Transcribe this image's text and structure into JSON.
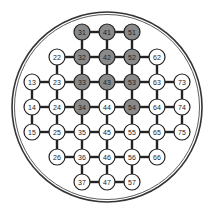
{
  "diagram": {
    "type": "solitaire-board",
    "colors": {
      "filled": "#8a8a8a",
      "empty": "#ffffff",
      "line": "#222222",
      "ring": "#333333"
    },
    "grid": {
      "origin_x": 32,
      "origin_y": 32,
      "step": 25,
      "node_radius": 8
    },
    "ring": {
      "cx": 107,
      "cy": 107,
      "r_outer": 95,
      "r_inner": 92.5
    },
    "nodes": [
      {
        "id": "31",
        "col": 3,
        "row": 1,
        "filled": true
      },
      {
        "id": "41",
        "col": 4,
        "row": 1,
        "filled": true
      },
      {
        "id": "51",
        "col": 5,
        "row": 1,
        "filled": true
      },
      {
        "id": "22",
        "col": 2,
        "row": 2,
        "filled": false
      },
      {
        "id": "32",
        "col": 3,
        "row": 2,
        "filled": true
      },
      {
        "id": "42",
        "col": 4,
        "row": 2,
        "filled": true
      },
      {
        "id": "52",
        "col": 5,
        "row": 2,
        "filled": true
      },
      {
        "id": "62",
        "col": 6,
        "row": 2,
        "filled": false
      },
      {
        "id": "13",
        "col": 1,
        "row": 3,
        "filled": false
      },
      {
        "id": "23",
        "col": 2,
        "row": 3,
        "filled": false
      },
      {
        "id": "33",
        "col": 3,
        "row": 3,
        "filled": true
      },
      {
        "id": "43",
        "col": 4,
        "row": 3,
        "filled": true
      },
      {
        "id": "53",
        "col": 5,
        "row": 3,
        "filled": true
      },
      {
        "id": "63",
        "col": 6,
        "row": 3,
        "filled": false
      },
      {
        "id": "73",
        "col": 7,
        "row": 3,
        "filled": false
      },
      {
        "id": "14",
        "col": 1,
        "row": 4,
        "filled": false
      },
      {
        "id": "24",
        "col": 2,
        "row": 4,
        "filled": false
      },
      {
        "id": "34",
        "col": 3,
        "row": 4,
        "filled": true
      },
      {
        "id": "44",
        "col": 4,
        "row": 4,
        "filled": false
      },
      {
        "id": "54",
        "col": 5,
        "row": 4,
        "filled": true
      },
      {
        "id": "64",
        "col": 6,
        "row": 4,
        "filled": false
      },
      {
        "id": "74",
        "col": 7,
        "row": 4,
        "filled": false
      },
      {
        "id": "15",
        "col": 1,
        "row": 5,
        "filled": false
      },
      {
        "id": "25",
        "col": 2,
        "row": 5,
        "filled": false
      },
      {
        "id": "35",
        "col": 3,
        "row": 5,
        "filled": false
      },
      {
        "id": "45",
        "col": 4,
        "row": 5,
        "filled": false
      },
      {
        "id": "55",
        "col": 5,
        "row": 5,
        "filled": false
      },
      {
        "id": "65",
        "col": 6,
        "row": 5,
        "filled": false
      },
      {
        "id": "75",
        "col": 7,
        "row": 5,
        "filled": false
      },
      {
        "id": "26",
        "col": 2,
        "row": 6,
        "filled": false
      },
      {
        "id": "36",
        "col": 3,
        "row": 6,
        "filled": false
      },
      {
        "id": "46",
        "col": 4,
        "row": 6,
        "filled": false
      },
      {
        "id": "56",
        "col": 5,
        "row": 6,
        "filled": false
      },
      {
        "id": "66",
        "col": 6,
        "row": 6,
        "filled": false
      },
      {
        "id": "37",
        "col": 3,
        "row": 7,
        "filled": false
      },
      {
        "id": "47",
        "col": 4,
        "row": 7,
        "filled": false
      },
      {
        "id": "57",
        "col": 5,
        "row": 7,
        "filled": false
      }
    ]
  }
}
